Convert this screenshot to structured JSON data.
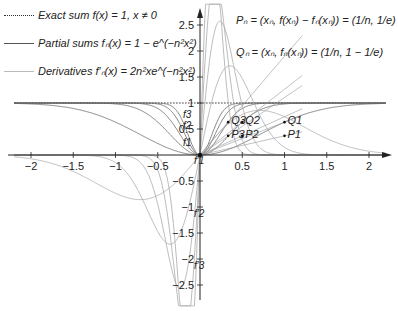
{
  "legend": [
    {
      "label": "Exact sum f(x) = 1, x ≠ 0",
      "style": "dotted",
      "color": "#333333"
    },
    {
      "label": "Partial sums fₙ(x) = 1 − e^(−n²x²)",
      "style": "solid",
      "color": "#555555"
    },
    {
      "label": "Derivatives f′ₙ(x) = 2n²xe^(−n²x²)",
      "style": "solid",
      "color": "#bbbbbb"
    }
  ],
  "annotations": {
    "P_def": "Pₙ = (xₙ, f(xₙ) − fₙ(xₙ)) = (1/n, 1/e)",
    "Q_def": "Qₙ = (xₙ, fₙ(xₙ)) = (1/n, 1 − 1/e)"
  },
  "chart_data": {
    "type": "line",
    "title": "",
    "xlabel": "",
    "ylabel": "",
    "xlim": [
      -2.3,
      2.3
    ],
    "ylim": [
      -2.9,
      2.9
    ],
    "grid": false,
    "legend_position": "upper-left",
    "x_ticks": [
      -2,
      -1.5,
      -1,
      -0.5,
      0.5,
      1,
      1.5,
      2
    ],
    "x_tick_labels": [
      "−2",
      "−1.5",
      "−1",
      "−0.5",
      "0.5",
      "1",
      "1.5",
      "2"
    ],
    "y_ticks": [
      -2.5,
      -2,
      -1.5,
      -1,
      -0.5,
      0.5,
      1,
      1.5,
      2,
      2.5
    ],
    "y_tick_labels": [
      "−2.5",
      "−2",
      "−1.5",
      "−1",
      "−0.5",
      "0.5",
      "1",
      "1.5",
      "2",
      "2.5"
    ],
    "series": [
      {
        "name": "Exact sum f(x)=1",
        "kind": "exact",
        "n": 0
      },
      {
        "name": "f1",
        "kind": "partial",
        "n": 1
      },
      {
        "name": "f2",
        "kind": "partial",
        "n": 2
      },
      {
        "name": "f3",
        "kind": "partial",
        "n": 3
      },
      {
        "name": "f4",
        "kind": "partial",
        "n": 4
      },
      {
        "name": "f5",
        "kind": "partial",
        "n": 5
      },
      {
        "name": "f'1",
        "kind": "derivative",
        "n": 1
      },
      {
        "name": "f'2",
        "kind": "derivative",
        "n": 2
      },
      {
        "name": "f'3",
        "kind": "derivative",
        "n": 3
      },
      {
        "name": "f'4",
        "kind": "derivative",
        "n": 4
      },
      {
        "name": "f'5",
        "kind": "derivative",
        "n": 5
      }
    ],
    "points": [
      {
        "name": "P1",
        "x": 1,
        "y": 0.368
      },
      {
        "name": "P2",
        "x": 0.5,
        "y": 0.368
      },
      {
        "name": "P3",
        "x": 0.333,
        "y": 0.368
      },
      {
        "name": "Q1",
        "x": 1,
        "y": 0.632
      },
      {
        "name": "Q2",
        "x": 0.5,
        "y": 0.632
      },
      {
        "name": "Q3",
        "x": 0.333,
        "y": 0.632
      }
    ],
    "curve_labels": [
      {
        "text": "f1",
        "x": -0.2,
        "y": 0.18
      },
      {
        "text": "f2",
        "x": -0.2,
        "y": 0.5
      },
      {
        "text": "f3",
        "x": -0.2,
        "y": 0.72
      },
      {
        "text": "f′1",
        "x": -0.07,
        "y": -0.18
      },
      {
        "text": "f′2",
        "x": -0.07,
        "y": -1.2
      },
      {
        "text": "f′3",
        "x": -0.07,
        "y": -2.2
      }
    ]
  }
}
